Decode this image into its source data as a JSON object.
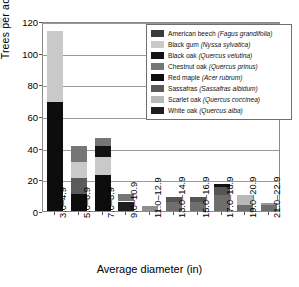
{
  "chart_data": {
    "type": "bar",
    "subtype": "stacked-bar",
    "title": "",
    "xlabel": "Average diameter (in)",
    "ylabel": "Trees per acre",
    "ylim": [
      0,
      120
    ],
    "yticks": [
      0,
      20,
      40,
      60,
      80,
      100,
      120
    ],
    "grid": true,
    "legend_position": "upper-right",
    "categories": [
      "3.0–4.9",
      "5.0–6.9",
      "7.0–8.9",
      "9.0–10.9",
      "11.0–12.9",
      "13.0–14.9",
      "15.0–16.9",
      "17.0–18.9",
      "19.0–20.9",
      "21.0–22.9"
    ],
    "series": [
      {
        "name": "American beech (Fagus grandifolia)",
        "color": "#3b3b3b",
        "values": [
          0,
          0,
          0,
          0,
          0,
          0,
          0,
          0,
          0,
          0
        ]
      },
      {
        "name": "Black gum (Nyssa sylvatica)",
        "color": "#c9c9c9",
        "values": [
          45,
          10,
          11,
          0,
          0,
          0,
          0,
          0,
          0,
          0
        ]
      },
      {
        "name": "Black oak (Quercus velutina)",
        "color": "#121212",
        "values": [
          0,
          0,
          7,
          0,
          0,
          0,
          0,
          2,
          0,
          0
        ]
      },
      {
        "name": "Chestnut oak (Quercus prinus)",
        "color": "#767676",
        "values": [
          0,
          10,
          5,
          5,
          0,
          3,
          0,
          5,
          0,
          1
        ]
      },
      {
        "name": "Red maple (Acer rubrum)",
        "color": "#0d0d0d",
        "values": [
          69,
          11,
          23,
          0,
          0,
          0,
          0,
          0,
          0,
          0
        ]
      },
      {
        "name": "Sassafras (Sassafras albidum)",
        "color": "#5a5a5a",
        "values": [
          0,
          10,
          0,
          0,
          0,
          0,
          3,
          0,
          0,
          0
        ]
      },
      {
        "name": "Scarlet oak (Quercus coccinea)",
        "color": "#b8b8b8",
        "values": [
          0,
          0,
          0,
          0,
          0,
          0,
          0,
          0,
          6,
          0
        ]
      },
      {
        "name": "White oak (Quercus alba)",
        "color": "#1e1e1e",
        "values": [
          0,
          0,
          0,
          6,
          3,
          6,
          6,
          10,
          4,
          4
        ]
      }
    ],
    "bar_totals": [
      114,
      41,
      46,
      11,
      3,
      9,
      9,
      17,
      10,
      5
    ],
    "stacks": [
      {
        "category": "3.0–4.9",
        "segments": [
          {
            "series": "Red maple (Acer rubrum)",
            "value": 69,
            "color": "#0d0d0d"
          },
          {
            "series": "Black gum (Nyssa sylvatica)",
            "value": 45,
            "color": "#c9c9c9"
          }
        ]
      },
      {
        "category": "5.0–6.9",
        "segments": [
          {
            "series": "Red maple (Acer rubrum)",
            "value": 11,
            "color": "#0d0d0d"
          },
          {
            "series": "Sassafras (Sassafras albidum)",
            "value": 10,
            "color": "#5a5a5a"
          },
          {
            "series": "Black gum (Nyssa sylvatica)",
            "value": 10,
            "color": "#c9c9c9"
          },
          {
            "series": "Chestnut oak (Quercus prinus)",
            "value": 10,
            "color": "#767676"
          }
        ]
      },
      {
        "category": "7.0–8.9",
        "segments": [
          {
            "series": "Red maple (Acer rubrum)",
            "value": 23,
            "color": "#0d0d0d"
          },
          {
            "series": "Black gum (Nyssa sylvatica)",
            "value": 11,
            "color": "#c9c9c9"
          },
          {
            "series": "Black oak (Quercus velutina)",
            "value": 7,
            "color": "#121212"
          },
          {
            "series": "Chestnut oak (Quercus prinus)",
            "value": 5,
            "color": "#767676"
          }
        ]
      },
      {
        "category": "9.0–10.9",
        "segments": [
          {
            "series": "White oak (Quercus alba)",
            "value": 6,
            "color": "#1e1e1e"
          },
          {
            "series": "Chestnut oak (Quercus prinus)",
            "value": 5,
            "color": "#767676"
          }
        ]
      },
      {
        "category": "11.0–12.9",
        "segments": [
          {
            "series": "White oak (Quercus alba)",
            "value": 3,
            "color": "#8f8f8f"
          }
        ]
      },
      {
        "category": "13.0–14.9",
        "segments": [
          {
            "series": "White oak (Quercus alba)",
            "value": 6,
            "color": "#6e6e6e"
          },
          {
            "series": "Chestnut oak (Quercus prinus)",
            "value": 3,
            "color": "#555555"
          }
        ]
      },
      {
        "category": "15.0–16.9",
        "segments": [
          {
            "series": "White oak (Quercus alba)",
            "value": 6,
            "color": "#6e6e6e"
          },
          {
            "series": "Sassafras (Sassafras albidum)",
            "value": 3,
            "color": "#555555"
          }
        ]
      },
      {
        "category": "17.0–18.9",
        "segments": [
          {
            "series": "White oak (Quercus alba)",
            "value": 10,
            "color": "#6e6e6e"
          },
          {
            "series": "Chestnut oak (Quercus prinus)",
            "value": 5,
            "color": "#555555"
          },
          {
            "series": "Black oak (Quercus velutina)",
            "value": 2,
            "color": "#121212"
          }
        ]
      },
      {
        "category": "19.0–20.9",
        "segments": [
          {
            "series": "White oak (Quercus alba)",
            "value": 4,
            "color": "#6e6e6e"
          },
          {
            "series": "Scarlet oak (Quercus coccinea)",
            "value": 6,
            "color": "#b8b8b8"
          }
        ]
      },
      {
        "category": "21.0–22.9",
        "segments": [
          {
            "series": "White oak (Quercus alba)",
            "value": 4,
            "color": "#6e6e6e"
          },
          {
            "series": "Chestnut oak (Quercus prinus)",
            "value": 1,
            "color": "#999999"
          }
        ]
      }
    ]
  },
  "axis": {
    "y_title": "Trees per acre",
    "x_title": "Average diameter (in)",
    "y_tick_labels": [
      "0",
      "20",
      "40",
      "60",
      "80",
      "100",
      "120"
    ],
    "x_tick_labels": [
      "3.0–4.9",
      "5.0–6.9",
      "7.0–8.9",
      "9.0–10.9",
      "11.0–12.9",
      "13.0–14.9",
      "15.0–16.9",
      "17.0–18.9",
      "19.0–20.9",
      "21.0–22.9"
    ]
  },
  "legend": {
    "entries": [
      {
        "common": "American beech",
        "latin": "(Fagus grandifolia)",
        "color": "#3b3b3b"
      },
      {
        "common": "Black gum",
        "latin": "(Nyssa sylvatica)",
        "color": "#c9c9c9"
      },
      {
        "common": "Black oak",
        "latin": "(Quercus velutina)",
        "color": "#121212"
      },
      {
        "common": "Chestnut oak",
        "latin": "(Quercus prinus)",
        "color": "#767676"
      },
      {
        "common": "Red maple",
        "latin": "(Acer rubrum)",
        "color": "#0d0d0d"
      },
      {
        "common": "Sassafras",
        "latin": "(Sassafras albidum)",
        "color": "#5a5a5a"
      },
      {
        "common": "Scarlet oak",
        "latin": "(Quercus coccinea)",
        "color": "#b8b8b8"
      },
      {
        "common": "White oak",
        "latin": "(Quercus alba)",
        "color": "#1e1e1e"
      }
    ]
  }
}
